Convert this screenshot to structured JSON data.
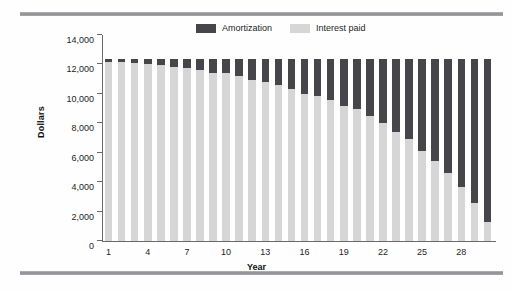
{
  "chart_data": {
    "type": "bar",
    "subtype": "stacked",
    "title": "",
    "xlabel": "Year",
    "ylabel": "Dollars",
    "ylim": [
      0,
      14000
    ],
    "ytick_labels": [
      "0",
      "2,000",
      "4,000",
      "6,000",
      "8,000",
      "10,000",
      "12,000",
      "14,000"
    ],
    "ytick_values": [
      0,
      2000,
      4000,
      6000,
      8000,
      10000,
      12000,
      14000
    ],
    "xtick_labels": [
      "1",
      "4",
      "7",
      "10",
      "13",
      "16",
      "19",
      "22",
      "25",
      "28"
    ],
    "xtick_values": [
      1,
      4,
      7,
      10,
      13,
      16,
      19,
      22,
      25,
      28
    ],
    "grid": false,
    "legend_position": "top-center",
    "categories": [
      1,
      2,
      3,
      4,
      5,
      6,
      7,
      8,
      9,
      10,
      11,
      12,
      13,
      14,
      15,
      16,
      17,
      18,
      19,
      20,
      21,
      22,
      23,
      24,
      25,
      26,
      27,
      28,
      29,
      30
    ],
    "series": [
      {
        "name": "Interest paid",
        "color": "#d6d6d6",
        "values": [
          12200,
          12150,
          12100,
          12050,
          11950,
          11850,
          11750,
          11600,
          11450,
          11400,
          11200,
          10950,
          10800,
          10600,
          10350,
          10000,
          9850,
          9550,
          9200,
          8950,
          8500,
          8050,
          7400,
          6900,
          6100,
          5450,
          4600,
          3650,
          2550,
          1300
        ]
      },
      {
        "name": "Amortization",
        "color": "#46464a",
        "values": [
          200,
          250,
          300,
          350,
          450,
          550,
          650,
          800,
          950,
          1000,
          1200,
          1450,
          1600,
          1800,
          2050,
          2400,
          2550,
          2850,
          3200,
          3450,
          3900,
          4350,
          5000,
          5500,
          6300,
          6950,
          7800,
          8750,
          9850,
          11100
        ]
      }
    ],
    "stack_total": 12400,
    "bar_count": 30
  },
  "legend": {
    "entries": [
      {
        "label": "Amortization",
        "color": "#46464a",
        "swatch": "legend-swatch-amortization"
      },
      {
        "label": "Interest paid",
        "color": "#d6d6d6",
        "swatch": "legend-swatch-interest"
      }
    ]
  },
  "axes": {
    "y_title": "Dollars",
    "x_title": "Year"
  }
}
